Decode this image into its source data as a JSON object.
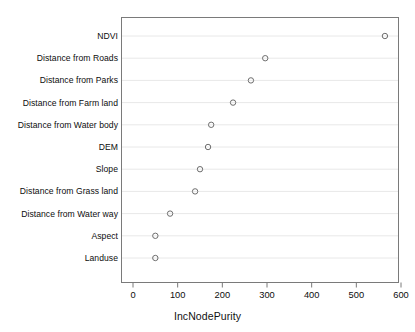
{
  "chart_data": {
    "type": "scatter",
    "title": "",
    "xlabel": "IncNodePurity",
    "ylabel": "",
    "orientation": "horizontal-dotplot",
    "grid": "horizontal-only",
    "legend": "none",
    "xlim": [
      0,
      600
    ],
    "xticks": [
      0,
      100,
      200,
      300,
      400,
      500,
      600
    ],
    "xtick_labels": [
      "0",
      "100",
      "200",
      "300",
      "400",
      "500",
      "600"
    ],
    "categories": [
      "NDVI",
      "Distance from Roads",
      "Distance from Parks",
      "Distance from Farm land",
      "Distance from Water body",
      "DEM",
      "Slope",
      "Distance from Grass land",
      "Distance from Water way",
      "Aspect",
      "Landuse"
    ],
    "values": [
      564,
      296,
      264,
      224,
      175,
      168,
      150,
      139,
      83,
      50,
      50
    ],
    "marker": "open-circle",
    "marker_color": "#6e6e6e",
    "box_color": "#7a7a7a",
    "gridline_color": "#e8e8e8"
  },
  "axis": {
    "x_title": "IncNodePurity"
  }
}
